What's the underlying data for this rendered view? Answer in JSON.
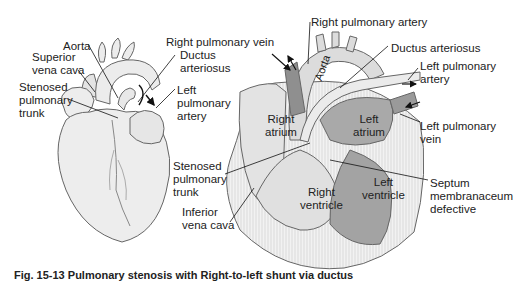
{
  "figure": {
    "caption_clipped": "Fig. 15-13 Pulmonary stenosis with Right-to-left shunt via ductus",
    "external_heart": {
      "labels": {
        "aorta": "Aorta",
        "superior_vena_cava": "Superior\nvena cava",
        "stenosed_pulmonary_trunk": "Stenosed\npulmonary\ntrunk",
        "ductus_arteriosus": "Ductus\narteriosus",
        "left_pulmonary_artery": "Left\npulmonary\nartery"
      }
    },
    "section_heart": {
      "labels": {
        "right_pulmonary_artery": "Right pulmonary artery",
        "right_pulmonary_vein": "Right pulmonary vein",
        "ductus_arteriosus": "Ductus arteriosus",
        "left_pulmonary_artery": "Left pulmonary\nartery",
        "aorta": "Aorta",
        "right_atrium": "Right\natrium",
        "left_atrium": "Left\natrium",
        "left_pulmonary_vein": "Left pulmonary\nvein",
        "stenosed_pulmonary_trunk": "Stenosed\npulmonary\ntrunk",
        "septum": "Septum\nmembranaceum\ndefective",
        "inferior_vena_cava": "Inferior\nvena cava",
        "right_ventricle": "Right\nventricle",
        "left_ventricle": "Left\nventricle"
      }
    },
    "colors": {
      "outline": "#555555",
      "light_fill": "#ececec",
      "mid_fill": "#d9d9d9",
      "dark_fill": "#a9a9a9",
      "vessel_dark": "#8f8f8f"
    }
  }
}
